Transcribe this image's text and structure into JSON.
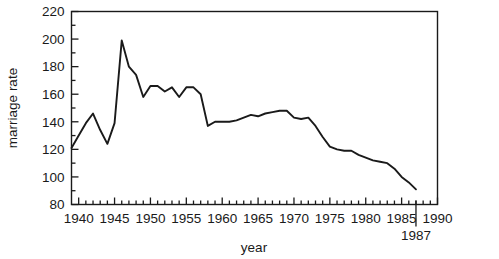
{
  "chart_data": {
    "type": "line",
    "title": "",
    "xlabel": "year",
    "ylabel": "marriage rate",
    "xlim": [
      1939,
      1990
    ],
    "ylim": [
      80,
      220
    ],
    "grid": false,
    "legend": null,
    "x_ticks_major": [
      1940,
      1945,
      1950,
      1955,
      1960,
      1965,
      1970,
      1975,
      1980,
      1985,
      1990
    ],
    "x_tick_labels": [
      "1940",
      "1945",
      "1950",
      "1955",
      "1960",
      "1965",
      "1970",
      "1975",
      "1980",
      "1985",
      "1990"
    ],
    "x_minor_tick_step": 1,
    "y_ticks_major": [
      80,
      100,
      120,
      140,
      160,
      180,
      200,
      220
    ],
    "y_tick_labels": [
      "80",
      "100",
      "120",
      "140",
      "160",
      "180",
      "200",
      "220"
    ],
    "y_minor_tick_step": 10,
    "annotations": [
      {
        "text": "1987",
        "x": 1987,
        "note": "end-of-series marker below axis"
      }
    ],
    "line_color": "#1a1a1a",
    "series": [
      {
        "name": "marriage rate",
        "x": [
          1939,
          1940,
          1941,
          1942,
          1943,
          1944,
          1945,
          1946,
          1947,
          1948,
          1949,
          1950,
          1951,
          1952,
          1953,
          1954,
          1955,
          1956,
          1957,
          1958,
          1959,
          1960,
          1961,
          1962,
          1963,
          1964,
          1965,
          1966,
          1967,
          1968,
          1969,
          1970,
          1971,
          1972,
          1973,
          1974,
          1975,
          1976,
          1977,
          1978,
          1979,
          1980,
          1981,
          1982,
          1983,
          1984,
          1985,
          1986,
          1987
        ],
        "values": [
          121,
          130,
          139,
          146,
          134,
          124,
          139,
          199,
          180,
          174,
          158,
          166,
          166,
          162,
          165,
          158,
          165,
          165,
          160,
          137,
          140,
          140,
          140,
          141,
          143,
          145,
          144,
          146,
          147,
          148,
          148,
          143,
          142,
          143,
          137,
          129,
          122,
          120,
          119,
          119,
          116,
          114,
          112,
          111,
          110,
          106,
          100,
          96,
          91
        ]
      }
    ]
  },
  "axes": {
    "y_label_text": "marriage rate",
    "x_label_text": "year"
  }
}
